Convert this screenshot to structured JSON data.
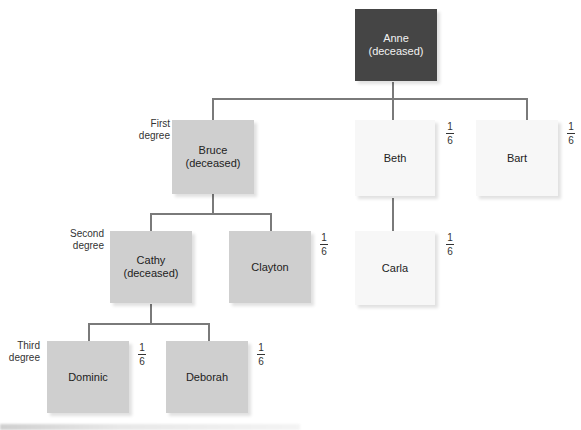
{
  "colors": {
    "deceased_root": "#454545",
    "bloodline": "#cfcfcf",
    "other": "#f7f7f7",
    "connector": "#7a7a7a"
  },
  "degrees": {
    "first": [
      "First",
      "degree"
    ],
    "second": [
      "Second",
      "degree"
    ],
    "third": [
      "Third",
      "degree"
    ]
  },
  "nodes": {
    "anne": {
      "name": "Anne",
      "note": "(deceased)"
    },
    "bruce": {
      "name": "Bruce",
      "note": "(deceased)"
    },
    "beth": {
      "name": "Beth",
      "share": {
        "num": "1",
        "den": "6"
      }
    },
    "bart": {
      "name": "Bart",
      "share": {
        "num": "1",
        "den": "6"
      }
    },
    "cathy": {
      "name": "Cathy",
      "note": "(deceased)"
    },
    "clayton": {
      "name": "Clayton",
      "share": {
        "num": "1",
        "den": "6"
      }
    },
    "carla": {
      "name": "Carla",
      "share": {
        "num": "1",
        "den": "6"
      }
    },
    "dominic": {
      "name": "Dominic",
      "share": {
        "num": "1",
        "den": "6"
      }
    },
    "deborah": {
      "name": "Deborah",
      "share": {
        "num": "1",
        "den": "6"
      }
    }
  }
}
